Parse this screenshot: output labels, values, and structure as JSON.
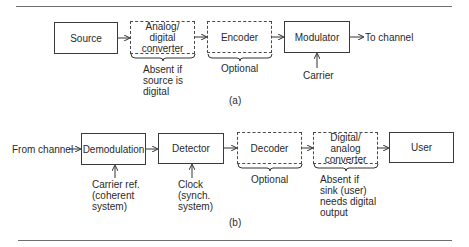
{
  "diagram_a": {
    "caption": "(a)",
    "blocks": [
      {
        "id": "source",
        "label": "Source",
        "style": "solid"
      },
      {
        "id": "ad_converter",
        "label": "Analog/\ndigital\nconverter",
        "style": "dashed"
      },
      {
        "id": "encoder",
        "label": "Encoder",
        "style": "dashed"
      },
      {
        "id": "modulator",
        "label": "Modulator",
        "style": "solid"
      }
    ],
    "output_label": "To channel",
    "notes": {
      "ad_converter": "Absent if\nsource is\ndigital",
      "encoder": "Optional",
      "modulator_input": "Carrier"
    }
  },
  "diagram_b": {
    "caption": "(b)",
    "input_label": "From channel",
    "blocks": [
      {
        "id": "demodulation",
        "label": "Demodulation",
        "style": "solid"
      },
      {
        "id": "detector",
        "label": "Detector",
        "style": "solid"
      },
      {
        "id": "decoder",
        "label": "Decoder",
        "style": "dashed"
      },
      {
        "id": "da_converter",
        "label": "Digital/\nanalog\nconverter",
        "style": "dashed"
      },
      {
        "id": "user",
        "label": "User",
        "style": "solid"
      }
    ],
    "notes": {
      "demodulation_input": "Carrier ref.\n(coherent\nsystem)",
      "detector_input": "Clock\n(synch.\nsystem)",
      "decoder": "Optional",
      "da_converter": "Absent if\nsink (user)\nneeds digital\noutput"
    }
  }
}
